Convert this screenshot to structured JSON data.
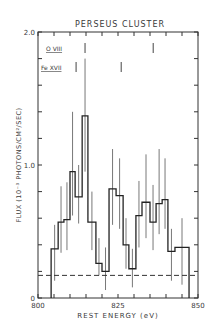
{
  "chart_data": {
    "type": "line",
    "style": "histogram-step-with-error-bars",
    "title": "PERSEUS CLUSTER",
    "xlabel": "REST ENERGY (eV)",
    "ylabel": "FLUX (10⁻³ PHOTONS/CM²/SEC)",
    "xlim": [
      800,
      850
    ],
    "ylim": [
      0,
      2.0
    ],
    "x_ticks": [
      800,
      825,
      850
    ],
    "y_ticks": [
      0,
      1.0,
      2.0
    ],
    "y_tick_labels": [
      "0",
      "1.0",
      "2.0"
    ],
    "x_tick_labels": [
      "800",
      "825",
      "850"
    ],
    "grid": false,
    "series": [
      {
        "name": "Flux",
        "bin_edges": [
          804.1,
          806.3,
          808.1,
          810.0,
          811.6,
          813.8,
          815.6,
          818.1,
          820.0,
          822.2,
          824.4,
          826.6,
          828.4,
          830.6,
          832.5,
          835.0,
          836.9,
          838.8,
          840.6,
          842.8,
          847.2
        ],
        "values": [
          0.37,
          0.57,
          0.59,
          0.95,
          0.76,
          1.37,
          0.57,
          0.26,
          0.2,
          0.82,
          0.77,
          0.4,
          0.22,
          0.62,
          0.72,
          0.57,
          0.71,
          0.74,
          0.35,
          0.38
        ],
        "error_upper": [
          0.55,
          0.84,
          0.87,
          1.4,
          1.0,
          1.8,
          0.8,
          0.45,
          0.38,
          1.12,
          1.05,
          0.6,
          0.37,
          0.88,
          1.08,
          0.85,
          1.12,
          1.05,
          0.52,
          0.6
        ],
        "error_lower": [
          0.13,
          0.34,
          0.36,
          0.62,
          0.56,
          0.95,
          0.36,
          0.17,
          0.06,
          0.55,
          0.52,
          0.22,
          0.08,
          0.38,
          0.45,
          0.36,
          0.48,
          0.52,
          0.13,
          0.1
        ]
      },
      {
        "name": "Background",
        "style": "dashed",
        "x": [
          800,
          850
        ],
        "values": [
          0.17,
          0.17
        ]
      }
    ],
    "annotations": [
      {
        "label": "O VIII",
        "line_energies": [
          814.7,
          836.0
        ]
      },
      {
        "label": "Fe XVII",
        "line_energies": [
          811.9,
          826.0
        ]
      }
    ]
  }
}
